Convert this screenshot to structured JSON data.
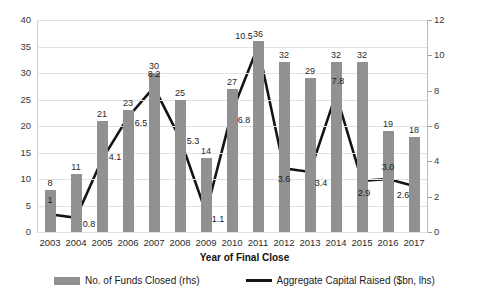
{
  "chart_data": {
    "type": "bar",
    "title": "",
    "subtitle": "",
    "xlabel": "Year of Final Close",
    "ylabel": "",
    "grid": true,
    "legend_position": "bottom",
    "categories": [
      "2003",
      "2004",
      "2005",
      "2006",
      "2007",
      "2008",
      "2009",
      "2010",
      "2011",
      "2012",
      "2013",
      "2014",
      "2015",
      "2016",
      "2017"
    ],
    "series": [
      {
        "name": "No. of Funds Closed (rhs)",
        "type": "bar",
        "axis": "left",
        "color": "#919191",
        "values": [
          8,
          11,
          21,
          23,
          30,
          25,
          14,
          27,
          36,
          32,
          29,
          32,
          32,
          19,
          18
        ],
        "labels": [
          "8",
          "11",
          "21",
          "23",
          "30",
          "25",
          "14",
          "27",
          "36",
          "32",
          "29",
          "32",
          "32",
          "19",
          "18"
        ]
      },
      {
        "name": "Aggregate Capital Raised ($bn, lhs)",
        "type": "line",
        "axis": "right",
        "color": "#141414",
        "values": [
          1.0,
          0.8,
          4.1,
          6.5,
          8.2,
          5.3,
          1.1,
          6.8,
          10.5,
          3.6,
          3.4,
          7.8,
          2.9,
          3.0,
          2.6
        ],
        "labels": [
          "1",
          "0.8",
          "4.1",
          "6.5",
          "8.2",
          "5.3",
          "1.1",
          "6.8",
          "10.5",
          "3.6",
          "3.4",
          "7.8",
          "2.9",
          "3.0",
          "2.6"
        ]
      }
    ],
    "left_axis": {
      "min": 0,
      "max": 40,
      "step": 5,
      "ticks": [
        "0",
        "5",
        "10",
        "15",
        "20",
        "25",
        "30",
        "35",
        "40"
      ]
    },
    "right_axis": {
      "min": 0,
      "max": 12,
      "step": 2,
      "ticks": [
        "0",
        "2",
        "4",
        "6",
        "8",
        "10",
        "12"
      ]
    }
  },
  "legend": {
    "items": [
      {
        "label": "No. of Funds Closed (rhs)",
        "marker": "bar-swatch"
      },
      {
        "label": "Aggregate Capital Raised ($bn, lhs)",
        "marker": "line-swatch"
      }
    ]
  }
}
